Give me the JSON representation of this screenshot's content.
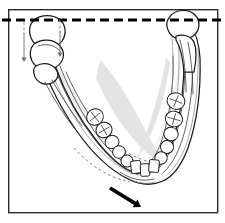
{
  "figure": {
    "caption": "",
    "background_color": "#ffffff",
    "border_color": "#2b2b2b",
    "line_color": "#1a1a1a",
    "shade_color": "#e3e3e3"
  },
  "frame": {
    "x": 8,
    "y": 9,
    "width": 209,
    "height": 203,
    "stroke_width": 1.4
  },
  "reference_line": {
    "name": "horizontal-reference-line",
    "style": "dashed",
    "color": "#000000",
    "y": 20,
    "x_start": 2,
    "x_end": 223,
    "dash": "9 5",
    "stroke_width": 3.1
  },
  "anatomy": {
    "left_condyle": {
      "name": "left-condyle-displaced",
      "position": "below-reference-line",
      "state": "displaced-inferiorly"
    },
    "right_condyle": {
      "name": "right-condyle-normal",
      "position": "on-reference-line",
      "state": "seated"
    },
    "left_ramus": {
      "name": "left-ramus"
    },
    "right_ramus": {
      "name": "right-ramus"
    },
    "mandibular_body": {
      "name": "mandibular-body"
    },
    "symphysis": {
      "name": "mandibular-symphysis"
    }
  },
  "displacement_arrows": [
    {
      "name": "left-condyle-drop-arrow-outer",
      "direction": "down",
      "x": 24,
      "y1": 33,
      "y2": 62
    },
    {
      "name": "left-condyle-drop-arrow-inner",
      "direction": "down",
      "x": 60,
      "y1": 31,
      "y2": 57
    }
  ],
  "guide_lines": [
    {
      "name": "left-condyle-guide-outer",
      "x": 24,
      "y1": 22,
      "y2": 34
    },
    {
      "name": "left-condyle-guide-inner",
      "x": 60,
      "y1": 20,
      "y2": 33
    }
  ],
  "chin_arrow": {
    "name": "chin-deviation-arrow",
    "direction": "down-right",
    "x1": 110,
    "y1": 188,
    "x2": 141,
    "y2": 207,
    "color": "#000000",
    "stroke_width": 3.6
  },
  "teeth": {
    "left_quadrant": [
      {
        "name": "tooth-left-molar-2",
        "type": "molar",
        "cx": 95,
        "cy": 117,
        "rx": 8.6,
        "ry": 8.0,
        "rot": -38,
        "cusps": true
      },
      {
        "name": "tooth-left-molar-1",
        "type": "molar",
        "cx": 104,
        "cy": 130,
        "rx": 8.2,
        "ry": 7.6,
        "rot": -30,
        "cusps": true
      },
      {
        "name": "tooth-left-premolar-2",
        "type": "premolar",
        "cx": 112,
        "cy": 142,
        "rx": 7.0,
        "ry": 6.6,
        "rot": -24,
        "cusps": false
      },
      {
        "name": "tooth-left-premolar-1",
        "type": "premolar",
        "cx": 119,
        "cy": 152,
        "rx": 6.4,
        "ry": 6.2,
        "rot": -18,
        "cusps": false
      },
      {
        "name": "tooth-left-canine",
        "type": "canine",
        "cx": 127,
        "cy": 161,
        "rx": 6.0,
        "ry": 6.0,
        "rot": -10,
        "cusps": false
      },
      {
        "name": "tooth-left-incisor-lateral",
        "type": "incisor",
        "cx": 136,
        "cy": 167,
        "rx": 5.0,
        "ry": 6.2,
        "rot": -6,
        "cusps": false
      },
      {
        "name": "tooth-left-incisor-central",
        "type": "incisor",
        "cx": 145,
        "cy": 170,
        "rx": 4.6,
        "ry": 6.2,
        "rot": -2,
        "cusps": false
      }
    ],
    "right_quadrant": [
      {
        "name": "tooth-right-molar-2",
        "type": "molar",
        "cx": 176,
        "cy": 101,
        "rx": 9.0,
        "ry": 8.2,
        "rot": 22,
        "cusps": true
      },
      {
        "name": "tooth-right-molar-1",
        "type": "molar",
        "cx": 174,
        "cy": 119,
        "rx": 8.6,
        "ry": 7.8,
        "rot": 16,
        "cusps": true
      },
      {
        "name": "tooth-right-premolar-2",
        "type": "premolar",
        "cx": 171,
        "cy": 134,
        "rx": 7.2,
        "ry": 6.8,
        "rot": 12,
        "cusps": false
      },
      {
        "name": "tooth-right-premolar-1",
        "type": "premolar",
        "cx": 167,
        "cy": 147,
        "rx": 6.6,
        "ry": 6.4,
        "rot": 10,
        "cusps": false
      },
      {
        "name": "tooth-right-canine",
        "type": "canine",
        "cx": 161,
        "cy": 158,
        "rx": 6.2,
        "ry": 6.2,
        "rot": 8,
        "cusps": false
      },
      {
        "name": "tooth-right-incisor-lateral",
        "type": "incisor",
        "cx": 154,
        "cy": 166,
        "rx": 5.0,
        "ry": 6.2,
        "rot": 5,
        "cusps": false
      }
    ]
  }
}
